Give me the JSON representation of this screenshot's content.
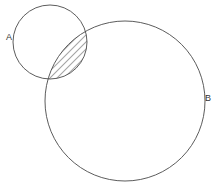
{
  "diagram": {
    "type": "venn",
    "sets": [
      {
        "id": "A",
        "label": "A",
        "cx": 50,
        "cy": 42,
        "r": 37,
        "label_x": 6,
        "label_y": 40
      },
      {
        "id": "B",
        "label": "B",
        "cx": 125,
        "cy": 101,
        "r": 80,
        "label_x": 205,
        "label_y": 101
      }
    ],
    "shaded_region": "A ∩ B",
    "shading_style": "diagonal-hatch",
    "colors": {
      "background": "#ffffff",
      "stroke": "#4a4a4a",
      "hatch": "#3a3a3a",
      "label": "#333333"
    }
  }
}
